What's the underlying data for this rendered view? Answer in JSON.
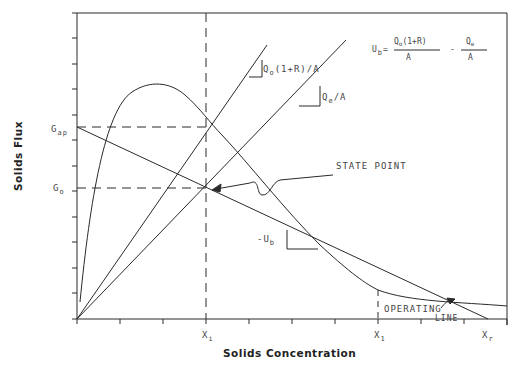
{
  "diagram": {
    "x_axis_title": "Solids Concentration",
    "y_axis_title": "Solids Flux",
    "y_labels": {
      "g_ap": {
        "main": "G",
        "sub": "ap"
      },
      "g_o": {
        "main": "G",
        "sub": "o"
      }
    },
    "x_labels": {
      "x_i": {
        "main": "X",
        "sub": "i"
      },
      "x_1": {
        "main": "X",
        "sub": "1"
      },
      "x_r": {
        "main": "X",
        "sub": "r"
      }
    },
    "annotations": {
      "state_point": "STATE POINT",
      "operating_line_1": "OPERATING",
      "operating_line_2": "LINE",
      "slope_underflow": {
        "main": "Q",
        "sub": "o",
        "rest": "(1+R)/A"
      },
      "slope_effluent": {
        "main": "Q",
        "sub": "e",
        "rest": "/A"
      },
      "slope_ub": {
        "main": "-U",
        "sub": "b"
      }
    },
    "equation": {
      "lhs_main": "U",
      "lhs_sub": "b",
      "equals": "=",
      "frac1_num_main": "Q",
      "frac1_num_sub": "o",
      "frac1_num_rest": "(1+R)",
      "frac1_den": "A",
      "minus": "-",
      "frac2_num_main": "Q",
      "frac2_num_sub": "e",
      "frac2_den": "A"
    },
    "colors": {
      "line": "#2a2a2a",
      "text": "#444444",
      "background": "#ffffff"
    }
  }
}
